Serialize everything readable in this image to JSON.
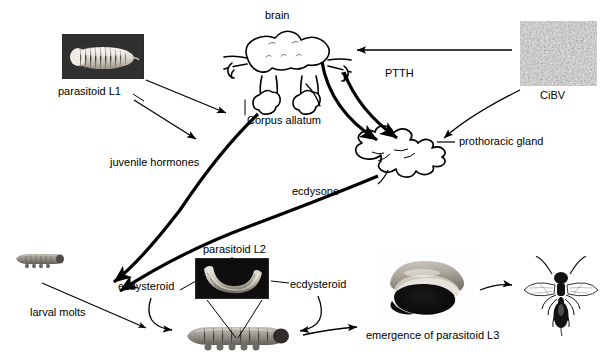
{
  "figure": {
    "background_color": "#ffffff",
    "line_color": "#000000",
    "text_color": "#000000"
  },
  "labels": {
    "brain": "brain",
    "parasitoid_l1": "parasitoid L1",
    "corpus_allatum": "Corpus allatum",
    "ptth": "PTTH",
    "cibv": "CiBV",
    "prothoracic_gland": "prothoracic gland",
    "juvenile_hormones": "juvenile hormones",
    "ecdysone": "ecdysone",
    "larval_molts": "larval molts",
    "ecdysteroid_left": "ecdysteroid",
    "ecdysteroid_right": "ecdysteroid",
    "parasitoid_l2": "parasitoid L2",
    "emergence_l3": "emergence of parasitoid L3"
  },
  "images": {
    "parasitoid_l1": {
      "caption": "parasitoid L1",
      "kind": "micrograph",
      "background": "#2b2b2b",
      "subject": "white segmented grub larva"
    },
    "cibv": {
      "caption": "CiBV",
      "kind": "electron-micrograph",
      "background": "#b9b9b9",
      "subject": "granular polydnavirus particle field"
    },
    "parasitoid_l2": {
      "caption": "parasitoid L2",
      "kind": "micrograph",
      "background": "#101010",
      "subject": "curved pale second-instar larva"
    },
    "emergence_l3": {
      "caption": "emergence of parasitoid L3",
      "kind": "photograph",
      "background": "#ffffff",
      "subject": "host caterpillar with emerging dark larva"
    },
    "host_caterpillar_small": {
      "kind": "micrograph",
      "subject": "small grey caterpillar"
    },
    "host_caterpillar_large": {
      "kind": "micrograph",
      "subject": "large grey caterpillar"
    },
    "adult_wasp": {
      "kind": "line-drawing",
      "subject": "adult parasitoid wasp, wings spread"
    },
    "brain_diagram": {
      "kind": "line-drawing",
      "subject": "insect brain with corpora allata"
    },
    "prothoracic_gland_diagram": {
      "kind": "line-drawing",
      "subject": "branched prothoracic gland outline"
    }
  }
}
